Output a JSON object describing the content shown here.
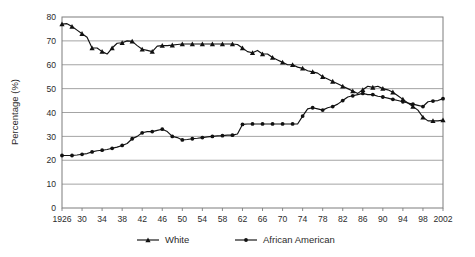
{
  "chart_data": {
    "type": "line",
    "title": "",
    "xlabel": "",
    "ylabel": "Percentage (%)",
    "ylim": [
      0,
      80
    ],
    "ytick_step": 10,
    "yticks": [
      "0",
      "10",
      "20",
      "30",
      "40",
      "50",
      "60",
      "70",
      "80"
    ],
    "xlim": [
      1926,
      2002
    ],
    "xtick_step": 4,
    "xticks": [
      "1926",
      "30",
      "34",
      "38",
      "42",
      "46",
      "50",
      "54",
      "58",
      "62",
      "66",
      "70",
      "74",
      "78",
      "82",
      "86",
      "90",
      "94",
      "98",
      "2002"
    ],
    "grid": "horizontal",
    "legend_position": "bottom",
    "x": [
      1926,
      1927,
      1928,
      1929,
      1930,
      1931,
      1932,
      1933,
      1934,
      1935,
      1936,
      1937,
      1938,
      1939,
      1940,
      1941,
      1942,
      1943,
      1944,
      1945,
      1946,
      1947,
      1948,
      1949,
      1950,
      1951,
      1952,
      1953,
      1954,
      1955,
      1956,
      1957,
      1958,
      1959,
      1960,
      1961,
      1962,
      1963,
      1964,
      1965,
      1966,
      1967,
      1968,
      1969,
      1970,
      1971,
      1972,
      1973,
      1974,
      1975,
      1976,
      1977,
      1978,
      1979,
      1980,
      1981,
      1982,
      1983,
      1984,
      1985,
      1986,
      1987,
      1988,
      1989,
      1990,
      1991,
      1992,
      1993,
      1994,
      1995,
      1996,
      1997,
      1998,
      1999,
      2000,
      2001,
      2002
    ],
    "series": [
      {
        "name": "White",
        "marker": "triangle",
        "color": "#111111",
        "values": [
          77.0,
          77.2,
          76.0,
          74.5,
          73.0,
          71.5,
          67.0,
          67.0,
          65.5,
          64.5,
          67.0,
          69.0,
          69.2,
          70.0,
          69.8,
          68.0,
          66.5,
          66.0,
          65.5,
          67.8,
          68.0,
          68.0,
          68.2,
          68.5,
          68.7,
          68.7,
          68.7,
          68.7,
          68.7,
          68.7,
          68.7,
          68.7,
          68.7,
          68.7,
          68.7,
          68.5,
          67.0,
          65.5,
          65.0,
          66.0,
          64.5,
          64.5,
          63.0,
          62.0,
          61.0,
          60.0,
          60.0,
          59.0,
          58.5,
          57.5,
          57.0,
          56.5,
          55.0,
          54.0,
          53.0,
          52.0,
          51.0,
          50.0,
          49.0,
          48.0,
          49.5,
          51.0,
          50.5,
          51.0,
          50.0,
          49.5,
          48.5,
          47.0,
          45.5,
          44.0,
          42.5,
          41.0,
          38.0,
          36.5,
          36.5,
          36.5,
          36.8
        ]
      },
      {
        "name": "African American",
        "marker": "circle",
        "color": "#111111",
        "values": [
          22.0,
          22.0,
          22.0,
          22.2,
          22.5,
          22.8,
          23.5,
          24.0,
          24.2,
          24.5,
          25.0,
          25.5,
          26.2,
          27.0,
          29.0,
          30.0,
          31.5,
          32.0,
          32.0,
          32.5,
          33.0,
          32.0,
          30.0,
          29.5,
          28.5,
          28.7,
          29.0,
          29.2,
          29.5,
          29.8,
          30.0,
          30.2,
          30.3,
          30.5,
          30.5,
          31.0,
          35.0,
          35.2,
          35.2,
          35.2,
          35.2,
          35.2,
          35.2,
          35.2,
          35.2,
          35.2,
          35.2,
          35.2,
          38.5,
          41.5,
          42.0,
          41.5,
          41.0,
          42.0,
          42.5,
          43.5,
          45.0,
          46.5,
          47.0,
          47.5,
          48.0,
          47.5,
          47.5,
          46.8,
          46.5,
          46.0,
          45.5,
          45.0,
          44.5,
          44.0,
          43.5,
          43.0,
          42.5,
          44.5,
          44.8,
          45.0,
          45.8
        ]
      }
    ]
  },
  "legend": {
    "items": [
      {
        "label": "White"
      },
      {
        "label": "African American"
      }
    ]
  }
}
